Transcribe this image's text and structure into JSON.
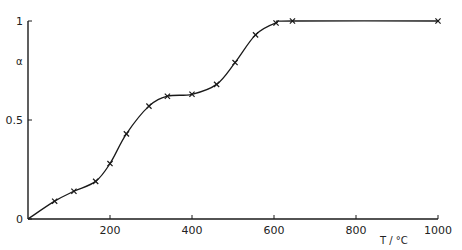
{
  "chart_data": {
    "type": "line",
    "title": "",
    "xlabel": "T / °C",
    "ylabel": "α",
    "xlim": [
      0,
      1000
    ],
    "ylim": [
      0,
      1
    ],
    "x_ticks": [
      200,
      400,
      600,
      800,
      1000
    ],
    "x_tick_labels": [
      "200",
      "400",
      "600",
      "800",
      "1000"
    ],
    "y_ticks": [
      0,
      0.5,
      1
    ],
    "y_tick_labels": [
      "0",
      "0.5",
      "1"
    ],
    "grid": false,
    "legend": null,
    "marker": "x",
    "series": [
      {
        "name": "α vs T",
        "x": [
          0,
          65,
          112,
          165,
          200,
          240,
          295,
          340,
          400,
          460,
          505,
          555,
          605,
          645,
          1000
        ],
        "y": [
          0,
          0.09,
          0.14,
          0.19,
          0.28,
          0.43,
          0.57,
          0.62,
          0.63,
          0.68,
          0.79,
          0.93,
          0.99,
          1.0,
          1.0
        ],
        "marked_points_start_index": 1
      }
    ]
  },
  "plot": {
    "ylabel": "α",
    "xlabel": "T / °C",
    "x_tick_labels": [
      "200",
      "400",
      "600",
      "800",
      "1000"
    ],
    "y_tick_labels": [
      "0",
      "0.5",
      "1"
    ]
  },
  "colors": {
    "line": "#1a1a1a",
    "background": "#ffffff"
  }
}
